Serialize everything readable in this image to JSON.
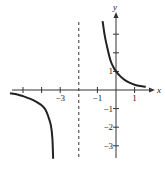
{
  "chart_data": {
    "type": "line",
    "title": "",
    "xlabel": "x",
    "ylabel": "y",
    "xlim": [
      -5.8,
      1.9
    ],
    "ylim": [
      -3.7,
      4.1
    ],
    "grid": false,
    "legend": null,
    "x_ticks": [
      -5,
      -4,
      -3,
      -2,
      -1,
      0,
      1
    ],
    "x_tick_labels": [
      {
        "value": -3,
        "label": "−3"
      },
      {
        "value": -1,
        "label": "−1"
      },
      {
        "value": 1,
        "label": "1"
      }
    ],
    "y_ticks": [
      -3,
      -2,
      -1,
      1,
      2,
      3
    ],
    "y_tick_labels": [
      {
        "value": 1,
        "label": "1"
      },
      {
        "value": -1,
        "label": "−1"
      },
      {
        "value": -2,
        "label": "−2"
      },
      {
        "value": -3,
        "label": "−3"
      }
    ],
    "asymptotes": [
      {
        "type": "vertical",
        "x": -2,
        "style": "dashed"
      }
    ],
    "series": [
      {
        "name": "right-branch",
        "points": [
          [
            -0.72,
            3.7
          ],
          [
            -0.6,
            2.9
          ],
          [
            -0.45,
            2.2
          ],
          [
            -0.3,
            1.6
          ],
          [
            -0.15,
            1.25
          ],
          [
            0,
            1
          ],
          [
            0.25,
            0.72
          ],
          [
            0.5,
            0.52
          ],
          [
            0.75,
            0.38
          ],
          [
            1,
            0.28
          ],
          [
            1.3,
            0.21
          ],
          [
            1.6,
            0.17
          ]
        ]
      },
      {
        "name": "left-branch",
        "points": [
          [
            -5.7,
            -0.17
          ],
          [
            -5.3,
            -0.24
          ],
          [
            -5,
            -0.33
          ],
          [
            -4.6,
            -0.48
          ],
          [
            -4.3,
            -0.62
          ],
          [
            -4,
            -0.82
          ],
          [
            -3.8,
            -1.05
          ],
          [
            -3.65,
            -1.4
          ],
          [
            -3.5,
            -1.9
          ],
          [
            -3.42,
            -2.6
          ],
          [
            -3.38,
            -3.7
          ]
        ]
      }
    ]
  }
}
